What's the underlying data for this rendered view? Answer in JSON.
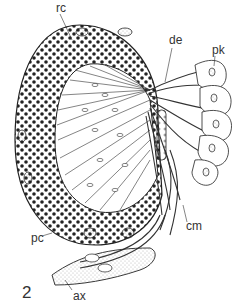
{
  "figure": {
    "number": "2",
    "labels": {
      "rc": "rc",
      "de": "de",
      "pk": "pk",
      "cm": "cm",
      "pc": "pc",
      "ax": "ax"
    }
  }
}
